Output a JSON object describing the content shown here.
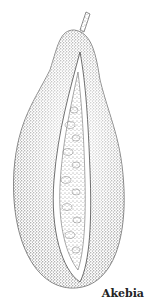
{
  "illustration": {
    "subject": "akebia-fruit",
    "style": "stippled pen drawing",
    "colors": {
      "ink": "#2a2a2a",
      "paper": "#ffffff"
    }
  },
  "caption": "Akebia"
}
